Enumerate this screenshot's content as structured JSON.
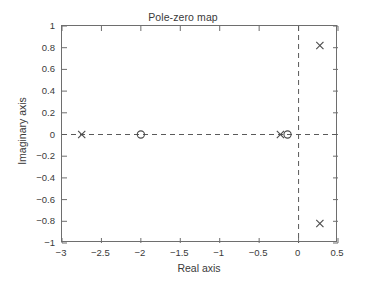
{
  "chart_data": {
    "type": "scatter",
    "title": "Pole-zero map",
    "xlabel": "Real axis",
    "ylabel": "Imaginary axis",
    "xlim": [
      -3,
      0.5
    ],
    "ylim": [
      -1,
      1
    ],
    "grid": false,
    "legend": "none",
    "xticks": [
      "-3",
      "-2.5",
      "-2",
      "-1.5",
      "-1",
      "-0.5",
      "0",
      "0.5"
    ],
    "xtick_values": [
      -3,
      -2.5,
      -2,
      -1.5,
      -1,
      -0.5,
      0,
      0.5
    ],
    "yticks": [
      "1",
      "0.8",
      "0.6",
      "0.4",
      "0.2",
      "0",
      "-0.2",
      "-0.4",
      "-0.6",
      "-0.8",
      "-1"
    ],
    "ytick_values": [
      1,
      0.8,
      0.6,
      0.4,
      0.2,
      0,
      -0.2,
      -0.4,
      -0.6,
      -0.8,
      -1
    ],
    "reference_lines": [
      {
        "name": "imaginary-axis-line",
        "orientation": "vertical",
        "value": 0,
        "style": "dashed"
      },
      {
        "name": "real-axis-line",
        "orientation": "horizontal",
        "value": 0,
        "style": "dashed"
      }
    ],
    "series": [
      {
        "name": "Poles",
        "marker": "x",
        "color": "#4a4a4a",
        "points": [
          {
            "x": -2.75,
            "y": 0
          },
          {
            "x": -0.23,
            "y": 0
          },
          {
            "x": 0.27,
            "y": 0.82
          },
          {
            "x": 0.27,
            "y": -0.82
          }
        ]
      },
      {
        "name": "Zeros",
        "marker": "o",
        "color": "#4a4a4a",
        "points": [
          {
            "x": -2.0,
            "y": 0
          },
          {
            "x": -0.14,
            "y": 0
          }
        ]
      }
    ]
  },
  "colors": {
    "axis": "#6e6e6e",
    "text": "#3a3a3a",
    "marker": "#4a4a4a",
    "background": "#ffffff"
  }
}
